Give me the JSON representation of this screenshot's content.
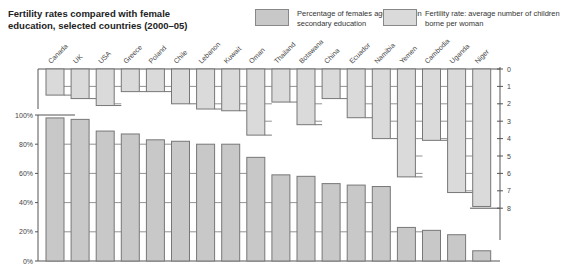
{
  "title": "Fertility rates compared with female education, selected countries (2000–05)",
  "title_lines": [
    "Fertility rates compared with female",
    "education, selected countries (2000–05)"
  ],
  "legend": [
    {
      "label": "Percentage of females aged 12–17 in secondary education",
      "color": "#c8c8c8"
    },
    {
      "label": "Fertility rate: average number of children borne per woman",
      "color": "#dadada"
    }
  ],
  "colors": {
    "education_bar": "#c8c8c8",
    "fertility_bar": "#dadada",
    "stroke": "#777777",
    "axis": "#555555"
  },
  "chart_data": [
    {
      "type": "bar",
      "title": "Percentage of females aged 12–17 in secondary education",
      "categories": [
        "Canada",
        "UK",
        "USA",
        "Greece",
        "Poland",
        "Chile",
        "Lebanon",
        "Kuwait",
        "Oman",
        "Thailand",
        "Botswana",
        "China",
        "Ecuador",
        "Namibia",
        "Yemen",
        "Cambodia",
        "Uganda",
        "Niger"
      ],
      "values": [
        98,
        97,
        89,
        87,
        83,
        82,
        80,
        80,
        71,
        59,
        58,
        53,
        52,
        51,
        23,
        21,
        18,
        7
      ],
      "ylabel": "",
      "yticks": [
        "0%",
        "20%",
        "40%",
        "60%",
        "80%",
        "100%"
      ],
      "ylim": [
        0,
        100
      ],
      "grid": false,
      "axis_position": "left"
    },
    {
      "type": "bar",
      "orientation": "hanging",
      "title": "Fertility rate: average number of children borne per woman",
      "categories": [
        "Canada",
        "UK",
        "USA",
        "Greece",
        "Poland",
        "Chile",
        "Lebanon",
        "Kuwait",
        "Oman",
        "Thailand",
        "Botswana",
        "China",
        "Ecuador",
        "Namibia",
        "Yemen",
        "Cambodia",
        "Uganda",
        "Niger"
      ],
      "values": [
        1.5,
        1.7,
        2.1,
        1.3,
        1.3,
        2.0,
        2.3,
        2.4,
        3.8,
        1.9,
        3.2,
        1.7,
        2.8,
        4.0,
        6.2,
        4.1,
        7.1,
        7.9
      ],
      "yticks": [
        "0",
        "1",
        "2",
        "3",
        "4",
        "5",
        "6",
        "7",
        "8"
      ],
      "ylim": [
        0,
        8
      ],
      "axis_position": "right",
      "inverted": true
    }
  ]
}
